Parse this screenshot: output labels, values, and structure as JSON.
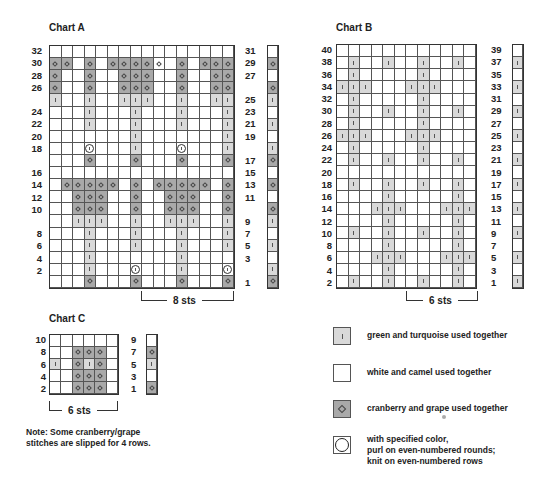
{
  "charts": {
    "A": {
      "title": "Chart A",
      "cols": 16,
      "left_labels": [
        "32",
        "30",
        "28",
        "26",
        "",
        "24",
        "22",
        "20",
        "18",
        "",
        "16",
        "14",
        "12",
        "10",
        "",
        "8",
        "6",
        "4",
        "2",
        ""
      ],
      "right_labels": [
        "31",
        "29",
        "27",
        "",
        "25",
        "23",
        "21",
        "19",
        "",
        "17",
        "15",
        "13",
        "11",
        "",
        "9",
        "7",
        "5",
        "3",
        "",
        "1"
      ],
      "rows": [
        "WWWWWWWWWWWWWWWW",
        "DDWDWDDDDdWDWDDD",
        "DWWDWWDDDWWDWWDD",
        "DWWDWWDDDWWDWWDD",
        "GWWGWWGGGWWGWWGG",
        "WWWGWWWGWWWGWWWG",
        "WWWGWWWGWWWGWWWG",
        "WWWWWWWGWWWWWWWG",
        "WWWCWWWGWWWCWWWG",
        "WWWDWWWDWWWDWWWD",
        "WWWWWWWWWWWWWWWW",
        "WDDDDDWDWDDDDDWD",
        "WWDDDWWDWWDDDWWD",
        "WWDDDWWDWWDDDWWD",
        "WWGGGWWGWWGGGWWG",
        "WWWGWWWGWWWGWWWG",
        "WWWGWWWGWWWGWWWG",
        "WWWGWWWWWWWGWWWW",
        "WWWGWWWCWWWGWWWC",
        "WWWDWWWDWWWDWWWD"
      ],
      "side_column": [
        "W",
        "D",
        "W",
        "D",
        "G",
        "W",
        "G",
        "W",
        "G",
        "D",
        "W",
        "D",
        "W",
        "D",
        "G",
        "W",
        "G",
        "W",
        "G",
        "D"
      ],
      "repeat_label": "8 sts"
    },
    "B": {
      "title": "Chart B",
      "cols": 12,
      "left_labels": [
        "40",
        "38",
        "36",
        "34",
        "32",
        "30",
        "28",
        "26",
        "24",
        "22",
        "20",
        "18",
        "16",
        "14",
        "12",
        "10",
        "8",
        "6",
        "4",
        "2"
      ],
      "right_labels": [
        "39",
        "37",
        "35",
        "33",
        "31",
        "29",
        "27",
        "25",
        "23",
        "21",
        "19",
        "17",
        "15",
        "13",
        "11",
        "9",
        "7",
        "5",
        "3",
        "1"
      ],
      "rows": [
        "WWWWWWWWWWWW",
        "WGWWGWWGWWGW",
        "WGWWWWWGWWWW",
        "GGGWWWGGGWWW",
        "WGWWWWWGWWWW",
        "WGWWGWWGWWGW",
        "WGWWWWWGWWWW",
        "GGGWWWGGGWWW",
        "WGWWWWWGWWWW",
        "WGWWGWWGWWGW",
        "WWWWWWWWWWWW",
        "WGWWGWWGWWGW",
        "WWWWGWWWWWGW",
        "WWWGGGWWWGGG",
        "WWWWGWWWWWGW",
        "WGWWGWWGWWGW",
        "WWWWGWWWWWGW",
        "WWWGGGWWWGGG",
        "WWWWGWWWWWGW",
        "WGWWGWWGWWGW"
      ],
      "side_column": [
        "W",
        "G",
        "W",
        "G",
        "W",
        "G",
        "W",
        "G",
        "W",
        "G",
        "W",
        "G",
        "W",
        "G",
        "W",
        "G",
        "W",
        "G",
        "W",
        "G"
      ],
      "repeat_label": "6 sts"
    },
    "C": {
      "title": "Chart C",
      "cols": 6,
      "left_labels": [
        "10",
        "8",
        "6",
        "4",
        "2"
      ],
      "right_labels": [
        "9",
        "7",
        "5",
        "3",
        "1"
      ],
      "rows": [
        "WWWWWW",
        "WWDDDW",
        "GWDGDW",
        "WWDDDW",
        "WWDDDW"
      ],
      "side_column": [
        "W",
        "D",
        "G",
        "W",
        "D"
      ],
      "repeat_label": "6 sts"
    }
  },
  "note": {
    "line1": "Note: Some cranberry/grape",
    "line2": "stitches are slipped for 4 rows."
  },
  "legend": [
    {
      "symbol": "tick",
      "swatch": "G",
      "text": "green and turquoise used together",
      "icon": "tick-mark-icon"
    },
    {
      "symbol": "none",
      "swatch": "W",
      "text": "white and camel used together",
      "icon": "blank-square-icon"
    },
    {
      "symbol": "diamond",
      "swatch": "D",
      "text": "cranberry and grape used together",
      "icon": "diamond-icon"
    },
    {
      "symbol": "circle",
      "swatch": "W",
      "text_lines": [
        "with specified color,",
        "purl on even-numbered rounds;",
        "knit on even-numbered rows"
      ],
      "icon": "circle-icon"
    }
  ],
  "colors": {
    "green_turquoise": "#d9d9d9",
    "white_camel": "#ffffff",
    "cranberry_grape": "#a9a9a9",
    "grid_line": "#555555"
  }
}
